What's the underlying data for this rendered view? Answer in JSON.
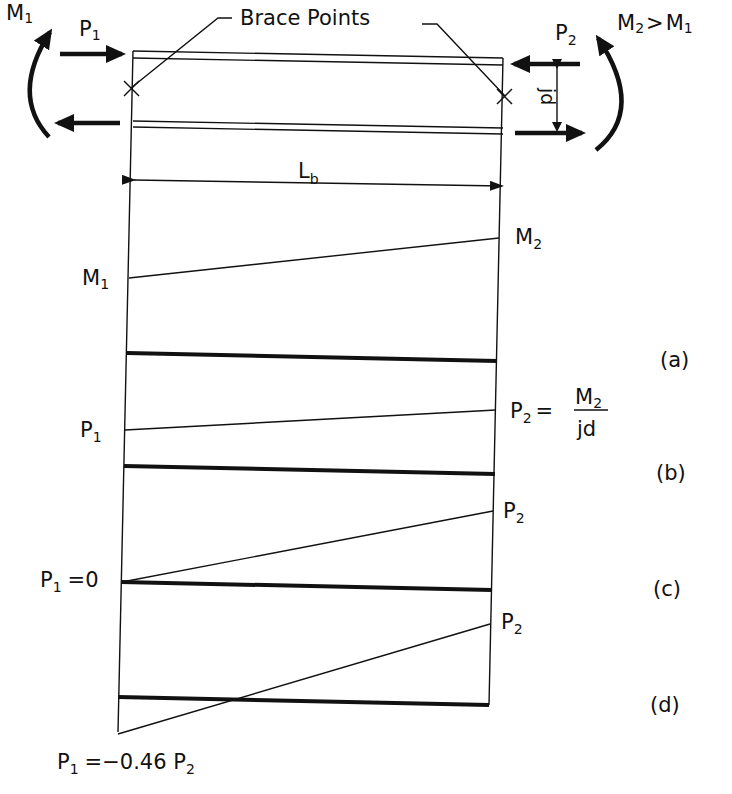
{
  "title_label": "Brace Points",
  "top_left": {
    "moment": "M",
    "moment_sub": "1",
    "force": "P",
    "force_sub": "1"
  },
  "top_right": {
    "force": "P",
    "force_sub": "2",
    "moment_relation": {
      "m2": "M",
      "m2_sub": "2",
      "op": ">",
      "m1": "M",
      "m1_sub": "1"
    },
    "lever_arm": "jd"
  },
  "span_label": {
    "main": "L",
    "sub": "b"
  },
  "panels": [
    {
      "id": "a",
      "tag": "(a)",
      "left_label": {
        "main": "M",
        "sub": "1"
      },
      "right_label": {
        "main": "M",
        "sub": "2"
      }
    },
    {
      "id": "b",
      "tag": "(b)",
      "left_label": {
        "main": "P",
        "sub": "1"
      },
      "right_label": {
        "main": "P",
        "sub": "2",
        "eq": "=",
        "numerator": "M",
        "numerator_sub": "2",
        "denominator": "jd"
      }
    },
    {
      "id": "c",
      "tag": "(c)",
      "left_label": {
        "main": "P",
        "sub": "1",
        "eq": "=0"
      },
      "right_label": {
        "main": "P",
        "sub": "2"
      }
    },
    {
      "id": "d",
      "tag": "(d)",
      "left_label": {
        "main": "P",
        "sub": "1",
        "eq": "=−0.46 P",
        "eq_sub": "2"
      },
      "right_label": {
        "main": "P",
        "sub": "2"
      }
    }
  ]
}
